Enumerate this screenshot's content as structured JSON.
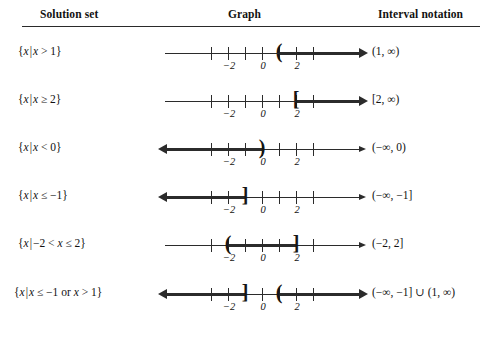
{
  "header": {
    "columns": [
      {
        "id": "solution-set",
        "label": "Solution set"
      },
      {
        "id": "graph",
        "label": "Graph"
      },
      {
        "id": "interval-notation",
        "label": "Interval notation"
      }
    ]
  },
  "axis": {
    "tick_values": [
      -3,
      -2,
      -1,
      0,
      1,
      2,
      3
    ],
    "labeled_ticks": [
      {
        "value": -2,
        "label": "−2"
      },
      {
        "value": 0,
        "label": "0"
      },
      {
        "value": 2,
        "label": "2"
      }
    ],
    "min": -3,
    "max": 3
  },
  "rows": [
    {
      "id": "row-1",
      "solution_set": "{x | x > 1}",
      "interval": "(1, ∞)",
      "graph": {
        "type": "ray-right",
        "endpoint": 1,
        "endpoint_symbol": "(",
        "included": false,
        "left_arrow": "thin",
        "right_arrow": "thick"
      }
    },
    {
      "id": "row-2",
      "solution_set": "{x | x ≥ 2}",
      "interval": "[2, ∞)",
      "graph": {
        "type": "ray-right",
        "endpoint": 2,
        "endpoint_symbol": "[",
        "included": true,
        "left_arrow": "thin",
        "right_arrow": "thick"
      }
    },
    {
      "id": "row-3",
      "solution_set": "{x | x < 0}",
      "interval": "(−∞, 0)",
      "graph": {
        "type": "ray-left",
        "endpoint": 0,
        "endpoint_symbol": ")",
        "included": false,
        "left_arrow": "thick",
        "right_arrow": "thin"
      }
    },
    {
      "id": "row-4",
      "solution_set": "{x | x ≤ −1}",
      "interval": "(−∞, −1]",
      "graph": {
        "type": "ray-left",
        "endpoint": -1,
        "endpoint_symbol": "]",
        "included": true,
        "left_arrow": "thick",
        "right_arrow": "thin"
      }
    },
    {
      "id": "row-5",
      "solution_set": "{x | −2 < x ≤ 2}",
      "interval": "(−2, 2]",
      "graph": {
        "type": "segment",
        "left_endpoint": -2,
        "right_endpoint": 2,
        "left_symbol": "(",
        "right_symbol": "]",
        "left_included": false,
        "right_included": true,
        "left_arrow": "thin",
        "right_arrow": "thin"
      }
    },
    {
      "id": "row-6",
      "solution_set": "{x | x ≤ −1 or x > 1}",
      "interval": "(−∞, −1] ∪ (1, ∞)",
      "graph": {
        "type": "union",
        "left_endpoint": -1,
        "left_symbol": "]",
        "right_endpoint": 1,
        "right_symbol": "(",
        "left_arrow": "thick",
        "right_arrow": "thick"
      }
    }
  ],
  "colors": {
    "ink": "#2b2b2b",
    "text": "#111111",
    "background": "#ffffff"
  }
}
